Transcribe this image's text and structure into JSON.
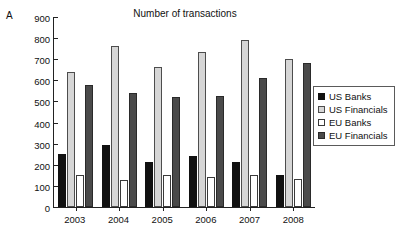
{
  "panel": {
    "label": "A"
  },
  "chart_data": {
    "type": "bar",
    "title": "Number of transactions",
    "xlabel": "",
    "ylabel": "",
    "ylim": [
      0,
      900
    ],
    "ytick_step": 100,
    "yticks": [
      900,
      800,
      700,
      600,
      500,
      400,
      300,
      200,
      100,
      0
    ],
    "categories": [
      "2003",
      "2004",
      "2005",
      "2006",
      "2007",
      "2008"
    ],
    "grid": false,
    "legend_position": "right",
    "series": [
      {
        "name": "US Banks",
        "color": "#111111",
        "values": [
          250,
          295,
          212,
          240,
          215,
          152
        ]
      },
      {
        "name": "US Financials",
        "color": "#d6d6d6",
        "values": [
          640,
          765,
          665,
          735,
          793,
          700
        ]
      },
      {
        "name": "EU Banks",
        "color": "#ffffff",
        "values": [
          150,
          128,
          150,
          140,
          150,
          132
        ]
      },
      {
        "name": "EU Financials",
        "color": "#4a4a4a",
        "values": [
          580,
          540,
          522,
          525,
          612,
          680
        ]
      }
    ]
  }
}
